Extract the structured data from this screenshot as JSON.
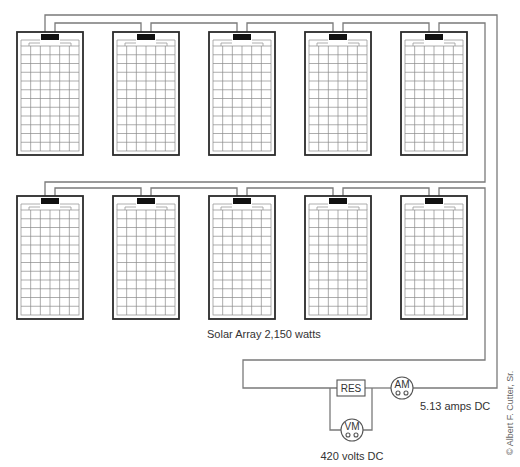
{
  "diagram": {
    "title": "Solar Array 2,150 watts",
    "array_label": "Solar Array 2,150 watts",
    "panel_rows": 2,
    "panels_per_row": 5,
    "panel_cell_columns": 6,
    "panel_cell_rows": 12,
    "components": {
      "resistor_label": "RES",
      "ammeter_label": "AM",
      "voltmeter_label": "VM"
    },
    "readings": {
      "current": "5.13 amps DC",
      "voltage": "420 volts DC"
    },
    "credit": "© Albert F. Cutter, Sr."
  },
  "colors": {
    "wire": "#7a7a7a",
    "panel_frame": "#2b2b2b",
    "junction_box": "#111111",
    "text": "#333333"
  }
}
